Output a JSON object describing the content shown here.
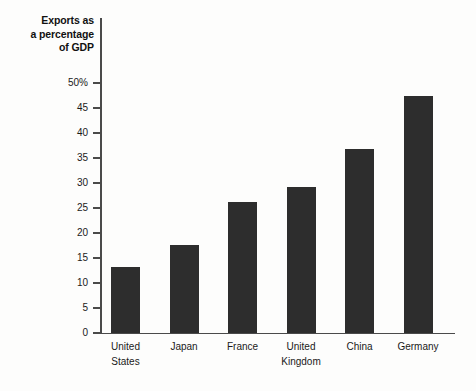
{
  "chart_data": {
    "type": "bar",
    "title": "Exports as a percentage of GDP",
    "title_lines": [
      "Exports as",
      "a percentage",
      "of GDP"
    ],
    "xlabel": "",
    "ylabel": "Exports as a percentage of GDP",
    "categories": [
      "United States",
      "Japan",
      "France",
      "United Kingdom",
      "China",
      "Germany"
    ],
    "category_lines": [
      [
        "United",
        "States"
      ],
      [
        "Japan"
      ],
      [
        "France"
      ],
      [
        "United",
        "Kingdom"
      ],
      [
        "China"
      ],
      [
        "Germany"
      ]
    ],
    "values": [
      13.2,
      17.6,
      26.3,
      29.2,
      36.8,
      47.5
    ],
    "ylim": [
      0,
      50
    ],
    "ytick_values": [
      0,
      5,
      10,
      15,
      20,
      25,
      30,
      35,
      40,
      45,
      50
    ],
    "ytick_labels": [
      "0",
      "5",
      "10",
      "15",
      "20",
      "25",
      "30",
      "35",
      "40",
      "45",
      "50%"
    ],
    "grid": false,
    "legend": null,
    "bar_color": "#2d2d2d",
    "axis_color": "#4a4a4a",
    "background_color": "#fdfdfc"
  }
}
